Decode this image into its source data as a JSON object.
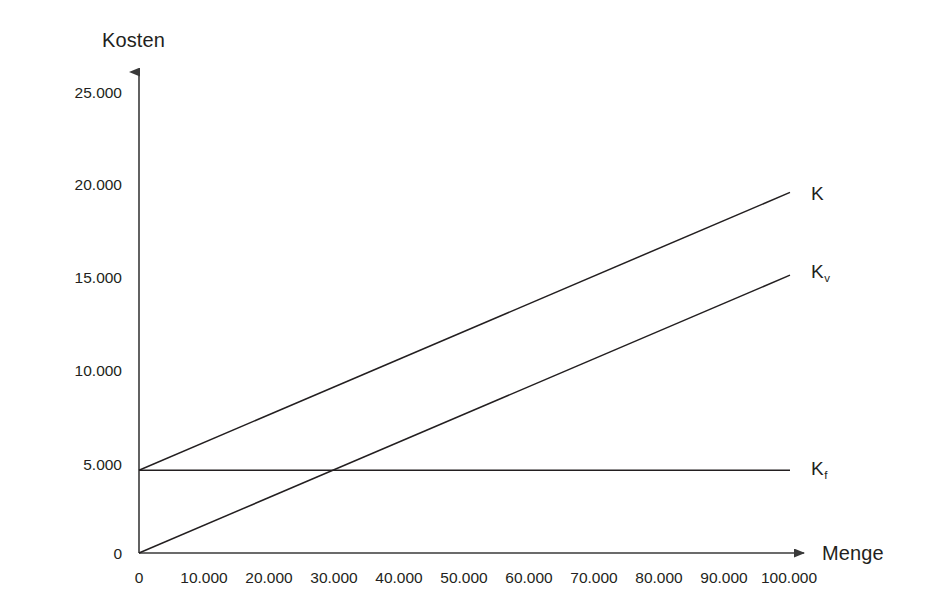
{
  "chart_data": {
    "type": "line",
    "title": "",
    "xlabel": "Menge",
    "ylabel": "Kosten",
    "xlim": [
      0,
      100000
    ],
    "ylim": [
      0,
      26500
    ],
    "grid": false,
    "legend_position": "right-of-line-ends",
    "x_ticks": [
      "0",
      "10.000",
      "20.000",
      "30.000",
      "40.000",
      "50.000",
      "60.000",
      "70.000",
      "80.000",
      "90.000",
      "100.000"
    ],
    "x_tick_values": [
      0,
      10000,
      20000,
      30000,
      40000,
      50000,
      60000,
      70000,
      80000,
      90000,
      100000
    ],
    "y_ticks": [
      "0",
      "5.000",
      "10.000",
      "15.000",
      "20.000",
      "25.000"
    ],
    "y_tick_values": [
      0,
      5000,
      10000,
      15000,
      20000,
      25000
    ],
    "x": [
      0,
      100000
    ],
    "series": [
      {
        "name": "K",
        "label": "K",
        "label_sub": "",
        "description": "Gesamtkosten",
        "values": [
          4500,
          19600
        ],
        "color": "#231f20"
      },
      {
        "name": "Kv",
        "label": "K",
        "label_sub": "v",
        "description": "variable Kosten",
        "values": [
          0,
          15100
        ],
        "color": "#231f20"
      },
      {
        "name": "Kf",
        "label": "K",
        "label_sub": "f",
        "description": "fixe Kosten",
        "values": [
          4500,
          4500
        ],
        "color": "#231f20"
      }
    ],
    "annotations": []
  },
  "axes": {
    "y_axis_title": "Kosten",
    "x_axis_title": "Menge"
  },
  "colors": {
    "line": "#231f20",
    "axis": "#3a3a3a",
    "background": "#ffffff",
    "text": "#231f20"
  }
}
